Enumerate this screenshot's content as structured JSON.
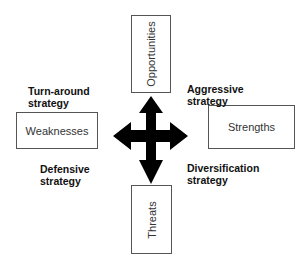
{
  "diagram": {
    "title": "",
    "nodes": {
      "opportunities": "Opportunities",
      "weaknesses": "Weaknesses",
      "strengths": "Strengths",
      "threats": "Threats"
    },
    "quadrant_labels": {
      "top_left": [
        "Turn-around",
        "strategy"
      ],
      "top_right": [
        "Aggressive",
        "strategy"
      ],
      "bottom_left": [
        "Defensive",
        "strategy"
      ],
      "bottom_right": [
        "Diversification",
        "strategy"
      ]
    },
    "center_icon": "four-way-arrow-icon",
    "colors": {
      "arrow": "#000000",
      "box_border": "#555555",
      "text": "#222222"
    }
  }
}
